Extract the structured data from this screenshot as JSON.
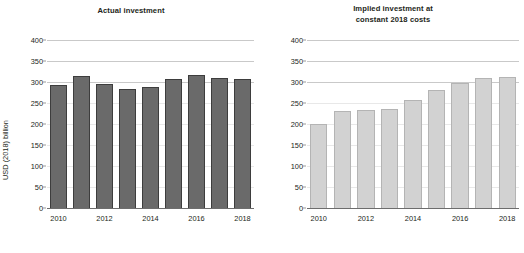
{
  "chart_data": [
    {
      "type": "bar",
      "panel": "left",
      "title": "Actual investment",
      "xlabel": "",
      "ylabel": "USD (2018) billion",
      "categories": [
        "2010",
        "2011",
        "2012",
        "2013",
        "2014",
        "2015",
        "2016",
        "2017",
        "2018"
      ],
      "values": [
        293,
        315,
        296,
        284,
        288,
        308,
        316,
        310,
        308
      ],
      "ylim": [
        0,
        400
      ],
      "yticks": [
        0,
        50,
        100,
        150,
        200,
        250,
        300,
        350,
        400
      ],
      "xtick_labels": [
        "2010",
        "2012",
        "2014",
        "2016",
        "2018"
      ],
      "grid": true,
      "legend": "none",
      "bar_color": "#6a6a6a",
      "bar_edge_color": "#3d3d3d"
    },
    {
      "type": "bar",
      "panel": "right",
      "title": "Implied investment at constant 2018 costs",
      "title_line1": "Implied investment at",
      "title_line2": "constant 2018 costs",
      "xlabel": "",
      "ylabel": "",
      "categories": [
        "2010",
        "2011",
        "2012",
        "2013",
        "2014",
        "2015",
        "2016",
        "2017",
        "2018"
      ],
      "values": [
        200,
        232,
        234,
        236,
        257,
        282,
        298,
        310,
        311
      ],
      "ylim": [
        0,
        400
      ],
      "yticks": [
        0,
        50,
        100,
        150,
        200,
        250,
        300,
        350,
        400
      ],
      "xtick_labels": [
        "2010",
        "2012",
        "2014",
        "2016",
        "2018"
      ],
      "grid": true,
      "legend": "none",
      "bar_color": "#d2d2d2",
      "bar_edge_color": "#b4b4b4"
    }
  ],
  "left_panel": {
    "title": "Actual investment",
    "ylabel": "USD (2018) billion",
    "yticks": [
      "400",
      "350",
      "300",
      "250",
      "200",
      "150",
      "100",
      "50",
      "0"
    ],
    "xticks": [
      "2010",
      "2012",
      "2014",
      "2016",
      "2018"
    ]
  },
  "right_panel": {
    "title_line1": "Implied investment at",
    "title_line2": "constant 2018 costs",
    "yticks": [
      "400",
      "350",
      "300",
      "250",
      "200",
      "150",
      "100",
      "50",
      "0"
    ],
    "xticks": [
      "2010",
      "2012",
      "2014",
      "2016",
      "2018"
    ]
  }
}
